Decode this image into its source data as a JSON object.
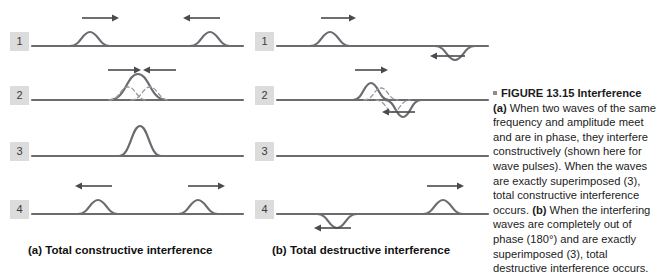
{
  "figure": {
    "number_label": "FIGURE 13.15",
    "title": "Interference",
    "bullet_icon": "square-bullet-icon",
    "caption_part_a_label": "(a)",
    "caption_part_a_text": " When two waves of the same frequency and amplitude meet and are in phase, they interfere constructively (shown here for wave pulses). When the waves are exactly superimposed (3), total constructive interference occurs. ",
    "caption_part_b_label": "(b)",
    "caption_part_b_text": " When the interfering waves are completely out of phase (180°) and are exactly superimposed (3), total destructive interference occurs."
  },
  "panels": [
    {
      "id": "a",
      "caption": "(a) Total constructive interference",
      "rows": [
        {
          "badge": "1",
          "description": "two-upward-pulses-approaching",
          "pulses": [
            {
              "center": 60,
              "amplitude": -14,
              "width": 40,
              "style": "solid"
            },
            {
              "center": 180,
              "amplitude": -14,
              "width": 40,
              "style": "solid"
            }
          ],
          "arrows": [
            {
              "x": 52,
              "y": 6,
              "direction": "right",
              "length": 32
            },
            {
              "x": 158,
              "y": 6,
              "direction": "left",
              "length": 32
            }
          ]
        },
        {
          "badge": "2",
          "description": "pulses-overlapping-partial-constructive",
          "pulses": [
            {
              "center": 108,
              "amplitude": -26,
              "width": 56,
              "style": "solid"
            },
            {
              "center": 98,
              "amplitude": -13,
              "width": 38,
              "style": "dashed"
            },
            {
              "center": 120,
              "amplitude": -13,
              "width": 38,
              "style": "dashed"
            }
          ],
          "arrows": [
            {
              "x": 78,
              "y": 4,
              "direction": "right",
              "length": 28
            },
            {
              "x": 118,
              "y": 4,
              "direction": "left",
              "length": 28
            }
          ]
        },
        {
          "badge": "3",
          "description": "single-tall-combined-pulse",
          "pulses": [
            {
              "center": 110,
              "amplitude": -30,
              "width": 42,
              "style": "solid"
            }
          ],
          "arrows": []
        },
        {
          "badge": "4",
          "description": "two-upward-pulses-separating",
          "pulses": [
            {
              "center": 68,
              "amplitude": -14,
              "width": 40,
              "style": "solid"
            },
            {
              "center": 168,
              "amplitude": -14,
              "width": 40,
              "style": "solid"
            }
          ],
          "arrows": [
            {
              "x": 50,
              "y": 6,
              "direction": "left",
              "length": 32
            },
            {
              "x": 158,
              "y": 6,
              "direction": "right",
              "length": 32
            }
          ]
        }
      ]
    },
    {
      "id": "b",
      "caption": "(b) Total destructive interference",
      "rows": [
        {
          "badge": "1",
          "description": "upward-pulse-and-downward-pulse-approaching",
          "pulses": [
            {
              "center": 55,
              "amplitude": -14,
              "width": 40,
              "style": "solid"
            },
            {
              "center": 180,
              "amplitude": 14,
              "width": 40,
              "style": "solid"
            }
          ],
          "arrows": [
            {
              "x": 46,
              "y": 6,
              "direction": "right",
              "length": 30
            },
            {
              "x": 160,
              "y": 44,
              "direction": "left",
              "length": 30
            }
          ]
        },
        {
          "badge": "2",
          "description": "pulses-overlapping-partial-cancellation",
          "pulses": [
            {
              "center": 96,
              "amplitude": -17,
              "width": 36,
              "style": "solid"
            },
            {
              "center": 128,
              "amplitude": 17,
              "width": 36,
              "style": "solid"
            },
            {
              "center": 106,
              "amplitude": -12,
              "width": 34,
              "style": "dashed"
            },
            {
              "center": 118,
              "amplitude": 12,
              "width": 34,
              "style": "dashed"
            }
          ],
          "arrows": [
            {
              "x": 80,
              "y": 4,
              "direction": "right",
              "length": 28
            },
            {
              "x": 112,
              "y": 46,
              "direction": "left",
              "length": 28
            }
          ]
        },
        {
          "badge": "3",
          "description": "flat-line-total-cancellation",
          "pulses": [],
          "arrows": []
        },
        {
          "badge": "4",
          "description": "downward-pulse-and-upward-pulse-separating",
          "pulses": [
            {
              "center": 62,
              "amplitude": 14,
              "width": 40,
              "style": "solid"
            },
            {
              "center": 168,
              "amplitude": -14,
              "width": 40,
              "style": "solid"
            }
          ],
          "arrows": [
            {
              "x": 44,
              "y": 48,
              "direction": "left",
              "length": 32
            },
            {
              "x": 152,
              "y": 6,
              "direction": "right",
              "length": 32
            }
          ]
        }
      ]
    }
  ],
  "colors": {
    "wave_line": "#6b6b70",
    "dashed_line": "#9a9aa0",
    "arrow": "#4a4a4f",
    "badge_bg": "#dcdcdc",
    "badge_text": "#3a3a3a",
    "text": "#1b1b1b"
  }
}
